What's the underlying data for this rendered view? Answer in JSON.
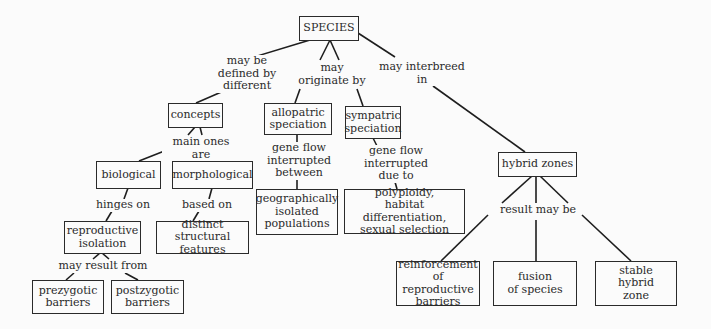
{
  "diagram": {
    "type": "concept-map",
    "root": "SPECIES",
    "nodes": {
      "species": "SPECIES",
      "concepts": "concepts",
      "allopatric": "allopatric\nspeciation",
      "sympatric": "sympatric\nspeciation",
      "hybrid_zones": "hybrid zones",
      "biological": "biological",
      "morphological": "morphological",
      "reproductive_isolation": "reproductive\nisolation",
      "distinct_structural": "distinct structural\nfeatures",
      "geographically_isolated": "geographically\nisolated\npopulations",
      "polyploidy": "polyploidy,\nhabitat differentiation,\nsexual selection",
      "prezygotic": "prezygotic\nbarriers",
      "postzygotic": "postzygotic\nbarriers",
      "reinforcement": "reinforcement\nof reproductive\nbarriers",
      "fusion": "fusion\nof species",
      "stable_hybrid": "stable\nhybrid\nzone"
    },
    "links": {
      "defined_by": "may be\ndefined by\ndifferent",
      "originate_by": "may\noriginate by",
      "interbreed": "may interbreed\nin",
      "main_ones": "main ones are",
      "hinges_on": "hinges on",
      "based_on": "based on",
      "allo_flow": "gene flow\ninterrupted\nbetween",
      "sym_flow": "gene flow\ninterrupted\ndue to",
      "result_from": "may result from",
      "result_may_be": "result may be"
    },
    "edges": [
      {
        "from": "SPECIES",
        "label": "may be defined by different",
        "to": "concepts"
      },
      {
        "from": "SPECIES",
        "label": "may originate by",
        "to": "allopatric speciation"
      },
      {
        "from": "SPECIES",
        "label": "may originate by",
        "to": "sympatric speciation"
      },
      {
        "from": "SPECIES",
        "label": "may interbreed in",
        "to": "hybrid zones"
      },
      {
        "from": "concepts",
        "label": "main ones are",
        "to": "biological"
      },
      {
        "from": "concepts",
        "label": "main ones are",
        "to": "morphological"
      },
      {
        "from": "biological",
        "label": "hinges on",
        "to": "reproductive isolation"
      },
      {
        "from": "morphological",
        "label": "based on",
        "to": "distinct structural features"
      },
      {
        "from": "reproductive isolation",
        "label": "may result from",
        "to": "prezygotic barriers"
      },
      {
        "from": "reproductive isolation",
        "label": "may result from",
        "to": "postzygotic barriers"
      },
      {
        "from": "allopatric speciation",
        "label": "gene flow interrupted between",
        "to": "geographically isolated populations"
      },
      {
        "from": "sympatric speciation",
        "label": "gene flow interrupted due to",
        "to": "polyploidy, habitat differentiation, sexual selection"
      },
      {
        "from": "hybrid zones",
        "label": "result may be",
        "to": "reinforcement of reproductive barriers"
      },
      {
        "from": "hybrid zones",
        "label": "result may be",
        "to": "fusion of species"
      },
      {
        "from": "hybrid zones",
        "label": "result may be",
        "to": "stable hybrid zone"
      }
    ]
  }
}
